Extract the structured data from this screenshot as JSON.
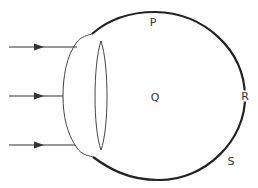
{
  "diagram": {
    "labels": {
      "P": "P",
      "Q": "Q",
      "R": "R",
      "S": "S"
    },
    "label_positions": {
      "P": [
        153,
        22
      ],
      "Q": [
        155,
        97
      ],
      "R": [
        245,
        96
      ],
      "S": [
        231,
        160
      ]
    },
    "rays": [
      {
        "y": 47,
        "direction": "right"
      },
      {
        "y": 96,
        "direction": "right"
      },
      {
        "y": 145,
        "direction": "right"
      }
    ],
    "parts": [
      "eyeball",
      "cornea",
      "lens",
      "light-rays"
    ],
    "colors": {
      "stroke": "#222222",
      "thin_stroke": "#444444",
      "label": "#333333"
    }
  }
}
